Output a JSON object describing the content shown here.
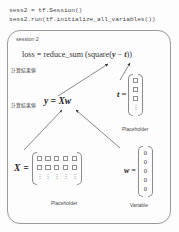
{
  "code": {
    "lines": [
      "sess2 = tf.Session()",
      "sess2.run(tf.initialize_all_variables())"
    ]
  },
  "diagram": {
    "session_label": "session 2",
    "loss_formula": {
      "lhs": "loss",
      "eq": "=",
      "rhs_prefix": "reduce_sum (square(",
      "var_y": "y",
      "minus": "−",
      "var_t": "t",
      "rhs_suffix": "))"
    },
    "annotations": {
      "computed_value": "計算結果値",
      "computed_result": "計算結果値"
    },
    "y_expression": "y = Xw",
    "tensors": {
      "t": {
        "symbol": "t",
        "equals": "=",
        "caption": "Placeholder",
        "rows": [
          "box",
          "box",
          "box",
          "dots"
        ],
        "cols": 1
      },
      "X": {
        "symbol": "X",
        "equals": "=",
        "caption": "Placeholder",
        "rows": [
          "box",
          "box",
          "dots"
        ],
        "cols": 5
      },
      "w": {
        "symbol": "w",
        "equals": "=",
        "caption": "Variable",
        "values": [
          "0",
          "0",
          "0",
          "0",
          "0"
        ],
        "cols": 1
      }
    },
    "dots_glyph": "⋮"
  },
  "colors": {
    "background": "#fdfdfd",
    "border": "#9a9a9a",
    "text": "#3a3a3a",
    "cell_border": "#8f8f8f"
  }
}
